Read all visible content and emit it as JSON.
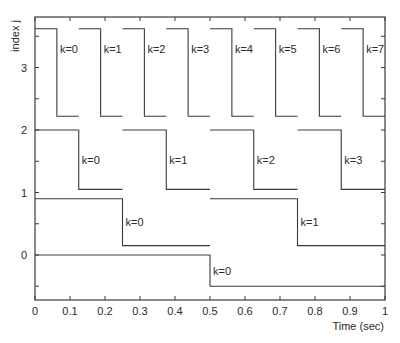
{
  "chart_data": {
    "type": "line",
    "title": "",
    "xlabel": "Time (sec)",
    "ylabel": "index j",
    "xlim": [
      0,
      1
    ],
    "ylim": [
      -0.75,
      3.7
    ],
    "grid": false,
    "x_ticks": [
      0,
      0.1,
      0.2,
      0.3,
      0.4,
      0.5,
      0.6,
      0.7,
      0.8,
      0.9,
      1
    ],
    "x_tick_labels": [
      "0",
      "0.1",
      "0.2",
      "0.3",
      "0.4",
      "0.5",
      "0.6",
      "0.7",
      "0.8",
      "0.9",
      "1"
    ],
    "y_ticks": [
      0,
      1,
      2,
      3
    ],
    "y_tick_labels": [
      "0",
      "1",
      "2",
      "3"
    ],
    "series": [
      {
        "name": "j=3",
        "high": 3.62,
        "low": 2.22,
        "count": 8,
        "labels": [
          "k=0",
          "k=1",
          "k=2",
          "k=3",
          "k=4",
          "k=5",
          "k=6",
          "k=7"
        ]
      },
      {
        "name": "j=2",
        "high": 2.0,
        "low": 1.05,
        "count": 4,
        "labels": [
          "k=0",
          "k=1",
          "k=2",
          "k=3"
        ]
      },
      {
        "name": "j=1",
        "high": 0.9,
        "low": 0.15,
        "count": 2,
        "labels": [
          "k=0",
          "k=1"
        ]
      },
      {
        "name": "j=0",
        "high": 0.0,
        "low": -0.5,
        "count": 1,
        "labels": [
          "k=0"
        ]
      }
    ]
  },
  "colors": {
    "line": "#3a3a3a",
    "text": "#2a2a2a",
    "background": "#ffffff"
  }
}
